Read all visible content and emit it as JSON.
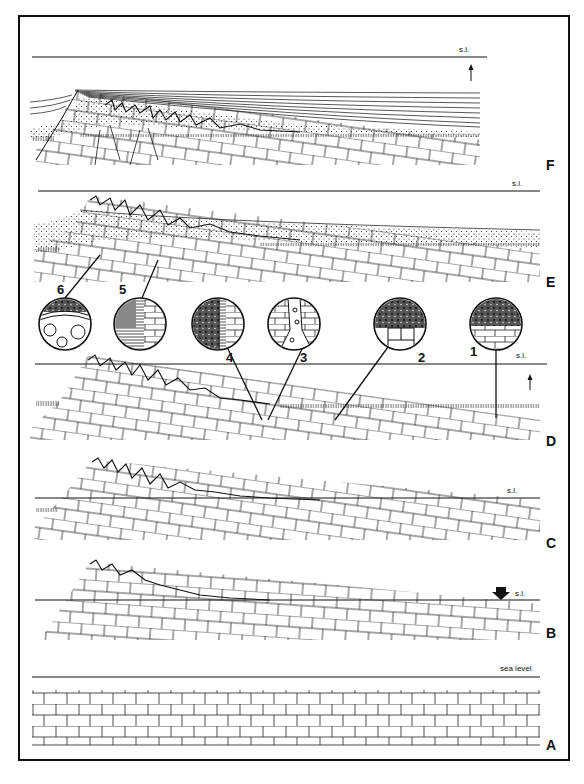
{
  "figure": {
    "panels": [
      {
        "id": "F",
        "label": "F",
        "sea_level_label": "s.l.",
        "sea_level_indicator": "arrow-up"
      },
      {
        "id": "E",
        "label": "E",
        "sea_level_label": "s.l.",
        "sea_level_indicator": ""
      },
      {
        "id": "D",
        "label": "D",
        "sea_level_label": "s.l.",
        "sea_level_indicator": "arrow-up"
      },
      {
        "id": "C",
        "label": "C",
        "sea_level_label": "s.l.",
        "sea_level_indicator": ""
      },
      {
        "id": "B",
        "label": "B",
        "sea_level_label": "s.l.",
        "sea_level_indicator": "arrow-down-bold"
      },
      {
        "id": "A",
        "label": "A",
        "sea_level_label": "sea level",
        "sea_level_indicator": ""
      }
    ],
    "insets": [
      {
        "number": "1"
      },
      {
        "number": "2"
      },
      {
        "number": "3"
      },
      {
        "number": "4"
      },
      {
        "number": "5"
      },
      {
        "number": "6"
      }
    ],
    "colors": {
      "ink": "#111111",
      "background": "#ffffff"
    }
  }
}
